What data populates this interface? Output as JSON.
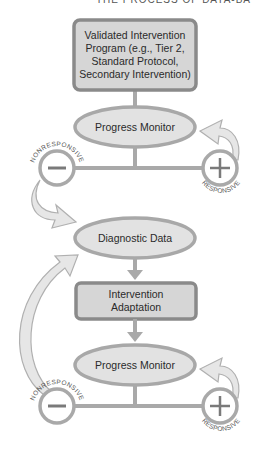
{
  "header": {
    "title": "THE PROCESS OF DATA-BA"
  },
  "diagram": {
    "top_box": {
      "label": "Validated Intervention Program (e.g., Tier 2, Standard Protocol, Secondary Intervention)"
    },
    "progress_monitor_1": {
      "label": "Progress Monitor"
    },
    "decision_1": {
      "negative": {
        "symbol": "minus",
        "label": "NONRESPONSIVE"
      },
      "positive": {
        "symbol": "plus",
        "label": "RESPONSIVE"
      }
    },
    "diagnostic": {
      "label": "Diagnostic Data"
    },
    "adaptation_box": {
      "label": "Intervention Adaptation"
    },
    "progress_monitor_2": {
      "label": "Progress Monitor"
    },
    "decision_2": {
      "negative": {
        "symbol": "minus",
        "label": "NONRESPONSIVE"
      },
      "positive": {
        "symbol": "plus",
        "label": "RESPONSIVE"
      }
    }
  },
  "colors": {
    "box_fill": "#d6d6d6",
    "box_border": "#8a8a8a",
    "ellipse_fill": "#e2e2e2",
    "ellipse_border": "#a8a8a8",
    "connector": "#a9a9a9",
    "arrow_fill": "#e6e6e6",
    "symbol": "#7a7a7a"
  }
}
